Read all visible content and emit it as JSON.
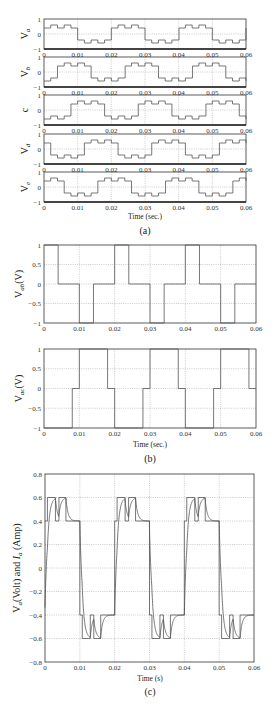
{
  "chart_data": [
    {
      "panel": "(a)",
      "type": "line",
      "step": true,
      "xlabel": "Time (sec.)",
      "xlim": [
        0,
        0.06
      ],
      "xticks": [
        "0",
        "0.01",
        "0.02",
        "0.03",
        "0.04",
        "0.05",
        "0.06"
      ],
      "ylim": [
        -1,
        1
      ],
      "yticks": [
        "-1",
        "0",
        "1"
      ],
      "grid": true,
      "subplots": [
        {
          "ylabel": "V",
          "ysub": "a",
          "phase_ms": 0
        },
        {
          "ylabel": "V",
          "ysub": "b",
          "phase_ms": 4
        },
        {
          "ylabel": "c",
          "ysub": "",
          "phase_ms": 8
        },
        {
          "ylabel": "V",
          "ysub": "d",
          "phase_ms": 12
        },
        {
          "ylabel": "V",
          "ysub": "e",
          "phase_ms": 16
        }
      ],
      "period": 0.02,
      "half_cycle_levels": [
        {
          "t0": 0.0,
          "t1": 0.002,
          "v": 0.4
        },
        {
          "t0": 0.002,
          "t1": 0.004,
          "v": 0.6
        },
        {
          "t0": 0.004,
          "t1": 0.006,
          "v": 0.4
        },
        {
          "t0": 0.006,
          "t1": 0.008,
          "v": 0.6
        },
        {
          "t0": 0.008,
          "t1": 0.01,
          "v": 0.4
        }
      ]
    },
    {
      "panel": "(b)",
      "type": "line",
      "step": true,
      "xlabel": "Time (sec.)",
      "xlim": [
        0,
        0.06
      ],
      "xticks": [
        "0",
        "0.01",
        "0.02",
        "0.03",
        "0.04",
        "0.05",
        "0.06"
      ],
      "ylim": [
        -1,
        1
      ],
      "yticks": [
        "-1",
        "-0.5",
        "0",
        "0.5",
        "1"
      ],
      "grid": true,
      "subplots": [
        {
          "ylabel": "V",
          "ysub": "ab",
          "yunit": "(V)",
          "x": [
            0,
            0.004,
            0.004,
            0.01,
            0.01,
            0.014,
            0.014,
            0.02,
            0.02,
            0.024,
            0.024,
            0.03,
            0.03,
            0.034,
            0.034,
            0.04,
            0.04,
            0.044,
            0.044,
            0.05,
            0.05,
            0.054,
            0.054,
            0.06
          ],
          "y": [
            1,
            1,
            0,
            0,
            -1,
            -1,
            0,
            0,
            1,
            1,
            0,
            0,
            -1,
            -1,
            0,
            0,
            1,
            1,
            0,
            0,
            -1,
            -1,
            0,
            0
          ]
        },
        {
          "ylabel": "V",
          "ysub": "ac",
          "yunit": "(V)",
          "x": [
            0,
            0.008,
            0.008,
            0.01,
            0.01,
            0.018,
            0.018,
            0.02,
            0.02,
            0.028,
            0.028,
            0.03,
            0.03,
            0.038,
            0.038,
            0.04,
            0.04,
            0.048,
            0.048,
            0.05,
            0.05,
            0.058,
            0.058,
            0.06
          ],
          "y": [
            -1,
            -1,
            0,
            0,
            1,
            1,
            0,
            0,
            -1,
            -1,
            0,
            0,
            1,
            1,
            0,
            0,
            -1,
            -1,
            0,
            0,
            1,
            1,
            0,
            0
          ]
        }
      ]
    },
    {
      "panel": "(c)",
      "type": "line",
      "xlabel": "Time (s)",
      "ylabel": "V",
      "ysub": "a",
      "ylabel_rest": "(Volt) and ",
      "ylabel2": "I",
      "ysub2": "a",
      "yunit2": " (Amp)",
      "xlim": [
        0,
        0.06
      ],
      "xticks": [
        "0",
        "0.01",
        "0.02",
        "0.03",
        "0.04",
        "0.05",
        "0.06"
      ],
      "ylim": [
        -0.8,
        0.8
      ],
      "yticks": [
        "-0.8",
        "-0.6",
        "-0.4",
        "-0.2",
        "0",
        "0.2",
        "0.4",
        "0.6",
        "0.8"
      ],
      "grid": true,
      "series": [
        {
          "name": "Va (Volt)",
          "description": "stepped between 0.4 and 0.6 in positive half cycle, -0.4 and -0.6 in negative half cycle, switching sharply at 0.01 intervals"
        },
        {
          "name": "Ia (Amp)",
          "description": "exponential-rise current following voltage steps"
        }
      ],
      "positive_steps": [
        {
          "t0": 0.0,
          "t1": 0.0007,
          "v": 0.4
        },
        {
          "t0": 0.0007,
          "t1": 0.003,
          "v": 0.6
        },
        {
          "t0": 0.003,
          "t1": 0.004,
          "v": 0.4
        },
        {
          "t0": 0.004,
          "t1": 0.006,
          "v": 0.6
        },
        {
          "t0": 0.006,
          "t1": 0.01,
          "v": 0.4
        }
      ]
    }
  ],
  "captions": {
    "a": "(a)",
    "b": "(b)",
    "c": "(c)",
    "xlabel_a": "Time (sec.)",
    "xlabel_b": "Time (sec.)",
    "xlabel_c": "Time (s)"
  }
}
